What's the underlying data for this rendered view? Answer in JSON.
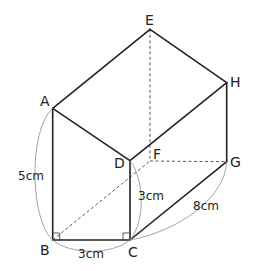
{
  "figure": {
    "type": "pentagonal-prism-diagram",
    "vertices": {
      "A": {
        "label": "A",
        "x": 52.7,
        "y": 108.3
      },
      "B": {
        "label": "B",
        "x": 52.7,
        "y": 240
      },
      "C": {
        "label": "C",
        "x": 130,
        "y": 240
      },
      "D": {
        "label": "D",
        "x": 130,
        "y": 160.7
      },
      "E": {
        "label": "E",
        "x": 150,
        "y": 29.3
      },
      "F": {
        "label": "F",
        "x": 150,
        "y": 161
      },
      "G": {
        "label": "G",
        "x": 226.7,
        "y": 161.7
      },
      "H": {
        "label": "H",
        "x": 226.7,
        "y": 82.7
      }
    },
    "dimensions": {
      "AB": "5cm",
      "BC": "3cm",
      "CD": "3cm",
      "CG": "8cm"
    },
    "right_angles": [
      "B",
      "C"
    ],
    "colors": {
      "edge": "#222222",
      "hidden": "#444444",
      "brace": "#9a9a9a"
    }
  }
}
